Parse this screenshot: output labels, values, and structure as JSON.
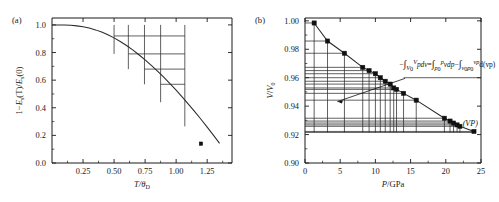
{
  "figure": {
    "background": "#ffffff",
    "ink": "#1a1a1a"
  },
  "panel_a": {
    "tag": "(a)",
    "xlabel_main": "T/",
    "xlabel_theta": "θ",
    "xlabel_sub": "D",
    "ylabel_parts": {
      "lead": "1−",
      "e1": "E",
      "e1sub": "s",
      "t": "(T)/",
      "e2": "E",
      "e2sub": "s",
      "zero": "(0)"
    },
    "x_ticks": [
      "0.25",
      "0.50",
      "0.75",
      "1.00",
      "1.25"
    ],
    "x_tick_values": [
      0.25,
      0.5,
      0.75,
      1.0,
      1.25
    ],
    "y_ticks": [
      "0.0",
      "0.2",
      "0.4",
      "0.6",
      "0.8",
      "1.0"
    ],
    "y_tick_values": [
      0.0,
      0.2,
      0.4,
      0.6,
      0.8,
      1.0
    ],
    "xlim": [
      0.0,
      1.45
    ],
    "ylim": [
      0.0,
      1.05
    ],
    "marker_point": {
      "x": 1.2,
      "y": 0.14
    }
  },
  "panel_b": {
    "tag": "(b)",
    "xlabel_main": "P",
    "xlabel_rest": "/GPa",
    "ylabel_v": "V",
    "ylabel_v2": "V",
    "ylabel_sub": "0",
    "x_ticks": [
      "0",
      "5",
      "10",
      "15",
      "20",
      "25"
    ],
    "x_tick_values": [
      0,
      5,
      10,
      15,
      20,
      25
    ],
    "y_ticks": [
      "0.90",
      "0.92",
      "0.94",
      "0.96",
      "0.98",
      "1.00"
    ],
    "y_tick_values": [
      0.9,
      0.92,
      0.94,
      0.96,
      0.98,
      1.0
    ],
    "xlim": [
      0,
      25
    ],
    "ylim": [
      0.9,
      1.002
    ],
    "annotation_vp": "(VP)",
    "equation": {
      "minus": "−",
      "int1": "∫",
      "int1_lower_v": "V",
      "int1_lower_sub": "0",
      "int1_upper": "V",
      "term1": "pdv",
      "equals": "=",
      "int2": "∫",
      "int2_lower_p": "p",
      "int2_lower_sub": "0",
      "int2_upper": "p",
      "term2": "vdp",
      "minus2": "−",
      "int3": "∫",
      "int3_lower": "v",
      "int3_lower_sub": "0",
      "int3_lower_p": "p",
      "int3_lower_psub": "0",
      "int3_upper": "vp",
      "term3": "d(vp)"
    }
  },
  "chart_data": [
    {
      "type": "line",
      "panel": "(a)",
      "title": "",
      "xlabel": "T/θ_D",
      "ylabel": "1−E_s(T)/E_s(0)",
      "xlim": [
        0.0,
        1.45
      ],
      "ylim": [
        0.0,
        1.05
      ],
      "xticks": [
        0.25,
        0.5,
        0.75,
        1.0,
        1.25
      ],
      "yticks": [
        0.0,
        0.2,
        0.4,
        0.6,
        0.8,
        1.0
      ],
      "grid": false,
      "legend": "none",
      "series": [
        {
          "name": "1-Es(T)/Es(0) curve",
          "x": [
            0.0,
            0.05,
            0.1,
            0.15,
            0.2,
            0.25,
            0.3,
            0.35,
            0.4,
            0.45,
            0.5,
            0.55,
            0.6,
            0.65,
            0.7,
            0.75,
            0.8,
            0.85,
            0.9,
            0.95,
            1.0,
            1.05,
            1.1,
            1.15,
            1.2,
            1.25,
            1.3,
            1.35
          ],
          "y": [
            1.0,
            1.0,
            0.999,
            0.997,
            0.993,
            0.986,
            0.977,
            0.964,
            0.948,
            0.929,
            0.906,
            0.88,
            0.851,
            0.819,
            0.784,
            0.747,
            0.707,
            0.665,
            0.621,
            0.575,
            0.527,
            0.477,
            0.425,
            0.372,
            0.317,
            0.26,
            0.202,
            0.142
          ]
        }
      ],
      "data_markers": [
        {
          "x": 1.2,
          "y": 0.14
        }
      ],
      "staircase_gridlines": {
        "description": "nested rectangular staircase of horizontal and vertical segments drawn from the curve toward the right/top",
        "horizontal_y": [
          0.92,
          0.79,
          0.68,
          0.57
        ],
        "horizontal_x_start": [
          0.5,
          0.615,
          0.745,
          0.875
        ],
        "horizontal_x_end": [
          1.07,
          1.07,
          1.07,
          1.07
        ],
        "vertical_x": [
          0.5,
          0.615,
          0.745,
          0.875,
          1.07
        ],
        "vertical_y_top": [
          1.0,
          1.0,
          1.0,
          1.0,
          1.0
        ],
        "vertical_y_bottom": [
          0.79,
          0.68,
          0.57,
          0.44,
          0.265
        ]
      }
    },
    {
      "type": "scatter",
      "panel": "(b)",
      "title": "",
      "xlabel": "P/GPa",
      "ylabel": "V/V_0",
      "xlim": [
        0,
        25
      ],
      "ylim": [
        0.9,
        1.002
      ],
      "xticks": [
        0,
        5,
        10,
        15,
        20,
        25
      ],
      "yticks": [
        0.9,
        0.92,
        0.94,
        0.96,
        0.98,
        1.0
      ],
      "grid": false,
      "legend": "none",
      "series": [
        {
          "name": "V/V0 vs P",
          "marker": "filled-square",
          "x": [
            1.3,
            3.2,
            5.6,
            8.2,
            9.1,
            10.0,
            10.7,
            11.4,
            12.1,
            12.6,
            13.0,
            14.0,
            15.8,
            19.8,
            20.6,
            21.1,
            21.6,
            22.0,
            24.0
          ],
          "y": [
            0.9985,
            0.9858,
            0.9772,
            0.9673,
            0.965,
            0.9628,
            0.96,
            0.9575,
            0.9555,
            0.9528,
            0.9518,
            0.949,
            0.9442,
            0.9315,
            0.9295,
            0.9281,
            0.9268,
            0.9258,
            0.9222
          ]
        }
      ],
      "rectangle_decomposition": {
        "description": "horizontal lines from y-axis to each data point and vertical lines from each data point down to baseline, illustrating integral by parts",
        "baseline_y": 0.9215,
        "horizontal_from_x": 0.0,
        "vertical_to_y": 0.9215
      },
      "annotations": [
        {
          "text": "−∫_{V_0}^{V} pdv = ∫_{p_0}^{p} vdp − ∫_{v_0p_0}^{vp} d(vp)",
          "x": 17.5,
          "y": 0.9695
        },
        {
          "text": "(VP)",
          "x": 22.6,
          "y": 0.9268
        }
      ]
    }
  ]
}
